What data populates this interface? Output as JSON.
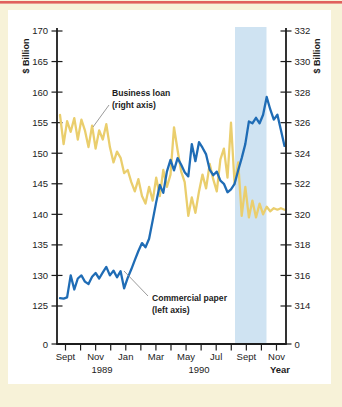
{
  "colors": {
    "page_bg": "#f7f2d8",
    "panel": "#ffffff",
    "top_rule": "#e0605c",
    "axis": "#1c1c1c",
    "blue": "#1f6cb5",
    "yellow": "#eace6d",
    "band": "#cfe3f2"
  },
  "chart_data": {
    "type": "line",
    "period": "Sep 1989 - Nov 1990",
    "frequency": "weekly",
    "left_axis": {
      "title": "$ Billion",
      "min": 125,
      "max": 170,
      "ticks": [
        170,
        165,
        160,
        155,
        150,
        145,
        140,
        135,
        130,
        125
      ],
      "zero_label": "0"
    },
    "right_axis": {
      "title": "$ Billion",
      "min": 314,
      "max": 332,
      "ticks": [
        332,
        330,
        328,
        326,
        324,
        322,
        320,
        318,
        316,
        314
      ],
      "zero_label": "0"
    },
    "x_axis": {
      "months_all": [
        "Sept",
        "Oct",
        "Nov",
        "Dec",
        "Jan",
        "Feb",
        "Mar",
        "Apr",
        "May",
        "Jun",
        "Jul",
        "Aug",
        "Sept",
        "Oct",
        "Nov"
      ],
      "labels_shown": [
        {
          "text": "Sept",
          "tick": 0
        },
        {
          "text": "Nov",
          "tick": 2
        },
        {
          "text": "Jan",
          "tick": 4
        },
        {
          "text": "Mar",
          "tick": 6
        },
        {
          "text": "May",
          "tick": 8
        },
        {
          "text": "Jul",
          "tick": 10
        },
        {
          "text": "Sept",
          "tick": 12
        },
        {
          "text": "Nov",
          "tick": 14
        }
      ],
      "years": [
        {
          "text": "1989"
        },
        {
          "text": "1990"
        }
      ],
      "axis_label": "Year"
    },
    "highlight_band": {
      "covers": "Aug 1990 to early Oct 1990",
      "color": "#cfe3f2"
    },
    "series": [
      {
        "name": "Business loan",
        "axis": "right",
        "color": "#eace6d",
        "values": [
          326.5,
          324.6,
          326.1,
          325.4,
          326.3,
          324.9,
          326.2,
          325.5,
          324.4,
          325.8,
          324.3,
          325.5,
          324.9,
          325.9,
          324.4,
          323.4,
          324.1,
          323.7,
          322.7,
          322.9,
          322.1,
          321.5,
          322.3,
          321.2,
          320.7,
          321.8,
          320.9,
          322.4,
          321.2,
          322.9,
          321.8,
          322.6,
          325.7,
          324.2,
          322.8,
          322.1,
          319.9,
          321.1,
          320.1,
          321.5,
          322.6,
          321.7,
          323.3,
          322.3,
          321.5,
          323.6,
          324.3,
          322.4,
          326.0,
          322.0,
          323.4,
          319.9,
          321.8,
          319.8,
          320.9,
          319.8,
          320.7,
          320.0,
          320.5,
          320.2,
          320.4,
          320.3,
          320.4,
          320.3
        ]
      },
      {
        "name": "Commercial paper",
        "axis": "left",
        "color": "#1f6cb5",
        "values": [
          126.3,
          126.2,
          126.4,
          130.0,
          127.7,
          129.5,
          130.0,
          129.0,
          128.6,
          129.8,
          130.4,
          129.5,
          130.5,
          131.4,
          130.0,
          130.8,
          129.7,
          130.7,
          127.9,
          129.6,
          131.0,
          132.5,
          134.0,
          135.3,
          134.6,
          136.0,
          139.0,
          142.0,
          144.8,
          143.5,
          147.0,
          148.9,
          147.2,
          149.2,
          148.1,
          146.9,
          146.2,
          151.5,
          148.7,
          151.8,
          150.9,
          149.8,
          147.3,
          146.4,
          147.0,
          145.5,
          145.0,
          143.6,
          144.1,
          145.0,
          147.2,
          149.2,
          151.5,
          155.2,
          154.9,
          155.8,
          154.9,
          156.3,
          159.2,
          157.2,
          155.5,
          156.3,
          153.8,
          151.2
        ]
      }
    ],
    "annotations": {
      "business_loan": {
        "line1": "Business loan",
        "line2": "(right axis)"
      },
      "commercial_paper": {
        "line1": "Commercial paper",
        "line2": "(left axis)"
      }
    }
  }
}
